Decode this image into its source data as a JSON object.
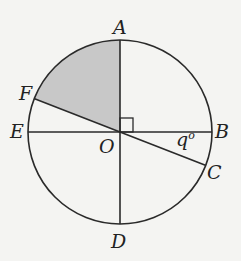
{
  "diagram": {
    "type": "circle-geometry",
    "center": "O",
    "points": {
      "A": "A",
      "B": "B",
      "C": "C",
      "D": "D",
      "E": "E",
      "F": "F",
      "O": "O"
    },
    "angle_label": "q°",
    "angle_q": "q",
    "degree_symbol": "o",
    "shaded_region": "sector AOF",
    "right_angle_at": "AOB",
    "colors": {
      "line": "#2a2a2a",
      "shade": "#c8c8c8",
      "background": "#f4f4f2"
    }
  }
}
